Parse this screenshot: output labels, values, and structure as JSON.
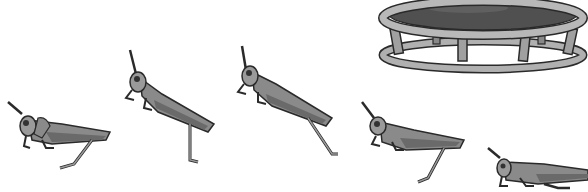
{
  "scene": {
    "description": "Sequence of five grasshoppers hopping toward a trampoline",
    "colors": {
      "background": "#ffffff",
      "body_light": "#9a9a9a",
      "body_mid": "#7a7a7a",
      "body_dark": "#4a4a4a",
      "outline": "#2a2a2a",
      "trampoline_mat": "#555555",
      "trampoline_frame": "#a8a8a8"
    },
    "grasshoppers": [
      {
        "id": 1,
        "pose": "crouched",
        "x": 0,
        "y": 95
      },
      {
        "id": 2,
        "pose": "leaping-upright",
        "x": 120,
        "y": 48
      },
      {
        "id": 3,
        "pose": "leaping-diagonal",
        "x": 234,
        "y": 44
      },
      {
        "id": 4,
        "pose": "landing",
        "x": 356,
        "y": 100
      },
      {
        "id": 5,
        "pose": "crouched",
        "x": 484,
        "y": 142
      }
    ],
    "trampoline": {
      "x": 378,
      "y": 0,
      "width": 208,
      "height": 72
    }
  }
}
